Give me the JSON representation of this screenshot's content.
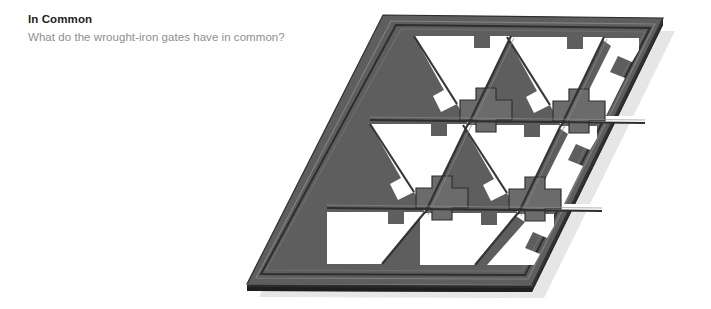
{
  "page": {
    "background_color": "#ffffff",
    "width": 711,
    "height": 309
  },
  "heading": {
    "title": "In Common",
    "title_color": "#1d1d1d",
    "subtitle": "What do the wrought-iron gates have in common?",
    "subtitle_color": "#8e8e8e"
  },
  "illustration": {
    "name": "wrought-iron-gate-panel",
    "description": "3D isometric wrought-iron gate panel",
    "shape": "parallelogram",
    "grid_rows": 3,
    "grid_columns": 3,
    "motifs": [
      "triangle-cutout",
      "cross-plus-shape"
    ],
    "colors": {
      "face_light": "#6e6e6e",
      "face_mid": "#5c5c5c",
      "face_dark": "#4a4a4a",
      "edge_dark": "#333333",
      "edge_darkest": "#262626",
      "bevel_highlight": "#8a8a8a",
      "shadow": "#cfcfcf",
      "cutout": "#ffffff"
    },
    "corners": {
      "top_left": [
        155,
        15
      ],
      "top_right": [
        435,
        18
      ],
      "bottom_right": [
        304,
        285
      ],
      "bottom_left": [
        19,
        284
      ]
    }
  }
}
